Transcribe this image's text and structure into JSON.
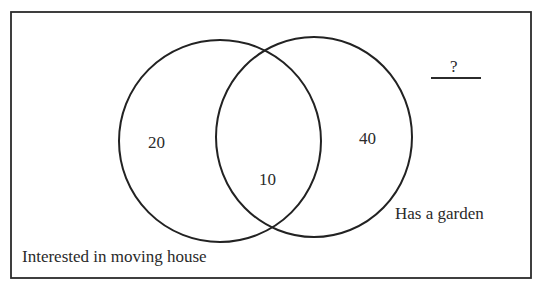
{
  "diagram": {
    "type": "venn",
    "frame": {
      "stroke": "#2b2b2b"
    },
    "sets": [
      {
        "label": "Interested in moving house",
        "only_count": "20"
      },
      {
        "label": "Has a garden",
        "only_count": "40"
      }
    ],
    "intersection_count": "10",
    "outside_count": "?",
    "colors": {
      "stroke": "#222222",
      "text": "#2a2a2a",
      "background": "#ffffff"
    }
  }
}
